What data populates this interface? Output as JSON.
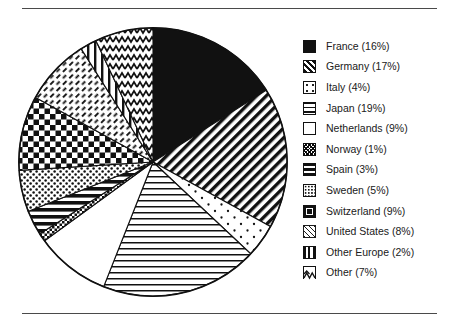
{
  "frame": {
    "has_top_rule": true,
    "has_bottom_rule": true
  },
  "chart_data": {
    "type": "pie",
    "title": "",
    "xlabel": "",
    "ylabel": "",
    "legend_position": "right",
    "grid": false,
    "units": "percent",
    "start_angle_deg": 0,
    "direction": "clockwise",
    "categories": [
      "France",
      "Germany",
      "Italy",
      "Japan",
      "Netherlands",
      "Norway",
      "Spain",
      "Sweden",
      "Switzerland",
      "United States",
      "Other Europe",
      "Other"
    ],
    "values": [
      16,
      17,
      4,
      19,
      9,
      1,
      3,
      5,
      9,
      8,
      2,
      7
    ],
    "slices": [
      {
        "label": "France",
        "value": 16,
        "legend_text": "France (16%)",
        "pattern": "solid-black"
      },
      {
        "label": "Germany",
        "value": 17,
        "legend_text": "Germany (17%)",
        "pattern": "diagonal-stripes"
      },
      {
        "label": "Italy",
        "value": 4,
        "legend_text": "Italy (4%)",
        "pattern": "sparse-dots"
      },
      {
        "label": "Japan",
        "value": 19,
        "legend_text": "Japan (19%)",
        "pattern": "horizontal-lines"
      },
      {
        "label": "Netherlands",
        "value": 9,
        "legend_text": "Netherlands (9%)",
        "pattern": "blank-white"
      },
      {
        "label": "Norway",
        "value": 1,
        "legend_text": "Norway (1%)",
        "pattern": "dense-crosshatch"
      },
      {
        "label": "Spain",
        "value": 3,
        "legend_text": "Spain (3%)",
        "pattern": "thick-horizontal-bars"
      },
      {
        "label": "Sweden",
        "value": 5,
        "legend_text": "Sweden (5%)",
        "pattern": "fine-dots"
      },
      {
        "label": "Switzerland",
        "value": 9,
        "legend_text": "Switzerland (9%)",
        "pattern": "checkerboard"
      },
      {
        "label": "United States",
        "value": 8,
        "legend_text": "United States (8%)",
        "pattern": "short-dashes"
      },
      {
        "label": "Other Europe",
        "value": 2,
        "legend_text": "Other Europe (2%)",
        "pattern": "vertical-lines"
      },
      {
        "label": "Other",
        "value": 7,
        "legend_text": "Other (7%)",
        "pattern": "zigzag-waves"
      }
    ],
    "colors": {
      "ink": "#111111",
      "background": "#ffffff",
      "rule": "#4a4a4a"
    }
  }
}
